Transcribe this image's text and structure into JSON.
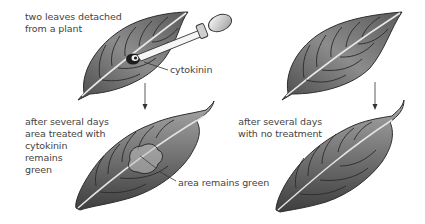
{
  "diagram": {
    "labels": {
      "intro": [
        "two leaves detached",
        "from a plant"
      ],
      "cytokinin": "cytokinin",
      "treated_result": [
        "after several days",
        "area treated with",
        "cytokinin",
        "remains",
        "green"
      ],
      "green_area": "area remains green",
      "untreated_result": [
        "after several days",
        "with no treatment"
      ]
    },
    "elements": [
      {
        "id": "leaf-treated-before",
        "description": "detached leaf with cytokinin applied by dropper"
      },
      {
        "id": "dropper",
        "description": "pipette applying cytokinin drop"
      },
      {
        "id": "leaf-untreated-before",
        "description": "detached leaf, untreated"
      },
      {
        "id": "arrow-left",
        "description": "arrow down: treated leaf after several days"
      },
      {
        "id": "arrow-right",
        "description": "arrow down: untreated leaf after several days"
      },
      {
        "id": "leaf-treated-after",
        "description": "wilted leaf with outlined green area"
      },
      {
        "id": "leaf-untreated-after",
        "description": "wilted leaf, fully yellowed"
      }
    ],
    "colors": {
      "background": "#ffffff",
      "text": "#444444",
      "leaf_dark": "#3c3c3c",
      "leaf_mid": "#8a8a8a",
      "leaf_light": "#d6d6d6",
      "line": "#333333"
    }
  }
}
